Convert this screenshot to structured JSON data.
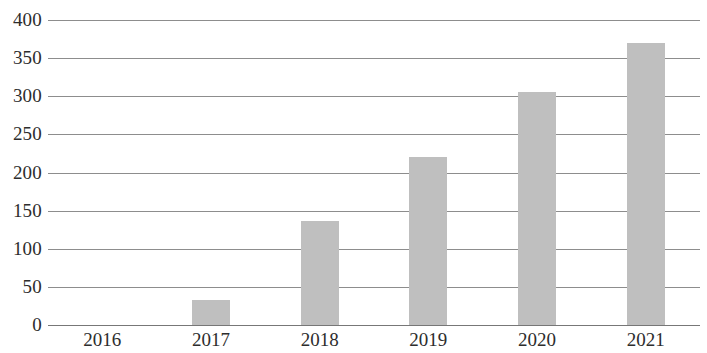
{
  "chart_data": {
    "type": "bar",
    "title": "",
    "subtitle": "",
    "xlabel": "",
    "ylabel": "",
    "categories": [
      "2016",
      "2017",
      "2018",
      "2019",
      "2020",
      "2021"
    ],
    "values": [
      0,
      33,
      136,
      220,
      305,
      370
    ],
    "ylim": [
      0,
      400
    ],
    "y_ticks": [
      0,
      50,
      100,
      150,
      200,
      250,
      300,
      350,
      400
    ],
    "y_tick_labels": [
      "0",
      "50",
      "100",
      "150",
      "200",
      "250",
      "300",
      "350",
      "400"
    ],
    "grid": true,
    "legend": false,
    "legend_position": "none",
    "annotations": [],
    "series": [
      {
        "name": "",
        "values": [
          0,
          33,
          136,
          220,
          305,
          370
        ]
      }
    ]
  },
  "style": {
    "bar_color": "#bfbfbf",
    "gridline_color": "#8d8d8d",
    "baseline_color": "#777777",
    "text_color": "#2d2d2d",
    "background": "#ffffff"
  }
}
